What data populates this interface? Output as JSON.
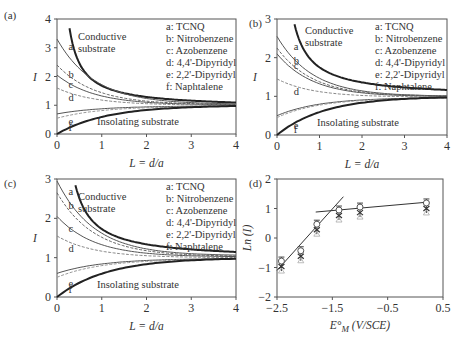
{
  "figure": {
    "legend": [
      "a: TCNQ",
      "b: Nitrobenzene",
      "c: Azobenzene",
      "d: 4,4'-Dipyridyl",
      "e: 2,2'-Dipyridyl",
      "f: Naphtalene"
    ],
    "curve_letters": [
      "a",
      "b",
      "c",
      "d",
      "e",
      "f"
    ],
    "conductive_label_1": "Conductive",
    "conductive_label_2": "substrate",
    "insolating_label": "Insolating substrate",
    "xlabel_abc": "L = d/a",
    "ylabel_abc": "I",
    "xlabel_d": "E°M (V/SCE)",
    "ylabel_d": "Ln (I)"
  },
  "chart_data": [
    {
      "panel": "(a)",
      "type": "line",
      "xlabel": "L = d/a",
      "ylabel": "I",
      "xlim": [
        0,
        4
      ],
      "ylim": [
        0,
        4
      ],
      "xticks": [
        "0",
        "1",
        "2",
        "3",
        "4"
      ],
      "yticks": [
        "0",
        "1",
        "2",
        "3",
        "4"
      ],
      "annotations": [
        "Conductive substrate",
        "Insolating substrate"
      ],
      "legend": [
        "a: TCNQ",
        "b: Nitrobenzene",
        "c: Azobenzene",
        "d: 4,4'-Dipyridyl",
        "e: 2,2'-Dipyridyl",
        "f: Naphtalene"
      ],
      "series": [
        {
          "name": "Conductive substrate",
          "I_at_L0": null,
          "I_at_L4": 1.05
        },
        {
          "name": "a: TCNQ",
          "I_at_L0": 3.3,
          "I_at_L4": 1.03
        },
        {
          "name": "b: Nitrobenzene",
          "I_at_L0": 2.4,
          "I_at_L4": 1.02
        },
        {
          "name": "c: Azobenzene",
          "I_at_L0": 2.05,
          "I_at_L4": 1.01
        },
        {
          "name": "d: 4,4'-Dipyridyl",
          "I_at_L0": 1.6,
          "I_at_L4": 1.0
        },
        {
          "name": "e: 2,2'-Dipyridyl",
          "I_at_L0": 0.7,
          "I_at_L4": 0.98
        },
        {
          "name": "f: Naphtalene",
          "I_at_L0": 0.55,
          "I_at_L4": 0.97
        },
        {
          "name": "Insolating substrate",
          "I_at_L0": 0.0,
          "I_at_L4": 0.95
        }
      ]
    },
    {
      "panel": "(b)",
      "type": "line",
      "xlabel": "L = d/a",
      "ylabel": "I",
      "xlim": [
        0,
        4
      ],
      "ylim": [
        0,
        3
      ],
      "xticks": [
        "0",
        "1",
        "2",
        "3",
        "4"
      ],
      "yticks": [
        "0",
        "1",
        "2",
        "3"
      ],
      "annotations": [
        "Conductive substrate",
        "Insolating substrate"
      ],
      "legend": [
        "a: TCNQ",
        "b: Nitrobenzene",
        "c: Azobenzene",
        "d: 4,4'-Dipyridyl",
        "e: 2,2'-Dipyridyl",
        "f: Naphtalene"
      ],
      "series": [
        {
          "name": "Conductive substrate",
          "I_at_L0": null,
          "I_at_L4": 1.12
        },
        {
          "name": "a: TCNQ",
          "I_at_L0": 2.55,
          "I_at_L4": 1.0
        },
        {
          "name": "b: Nitrobenzene",
          "I_at_L0": 2.25,
          "I_at_L4": 1.0
        },
        {
          "name": "c: Azobenzene",
          "I_at_L0": 2.1,
          "I_at_L4": 0.99
        },
        {
          "name": "d: 4,4'-Dipyridyl",
          "I_at_L0": 1.45,
          "I_at_L4": 0.98
        },
        {
          "name": "e: 2,2'-Dipyridyl",
          "I_at_L0": 0.5,
          "I_at_L4": 0.97
        },
        {
          "name": "f: Naphtalene",
          "I_at_L0": 0.45,
          "I_at_L4": 0.96
        },
        {
          "name": "Insolating substrate",
          "I_at_L0": 0.0,
          "I_at_L4": 0.95
        }
      ]
    },
    {
      "panel": "(c)",
      "type": "line",
      "xlabel": "L = d/a",
      "ylabel": "I",
      "xlim": [
        0,
        4
      ],
      "ylim": [
        0,
        3
      ],
      "xticks": [
        "0",
        "1",
        "2",
        "3",
        "4"
      ],
      "yticks": [
        "0",
        "1",
        "2",
        "3"
      ],
      "annotations": [
        "Conductive substrate",
        "Insolating substrate"
      ],
      "legend": [
        "a: TCNQ",
        "b: Nitrobenzene",
        "c: Azobenzene",
        "d: 4,4'-Dipyridyl",
        "e: 2,2'-Dipyridyl",
        "f: Naphtalene"
      ],
      "series": [
        {
          "name": "Conductive substrate",
          "I_at_L0": null,
          "I_at_L4": 1.1
        },
        {
          "name": "a: TCNQ",
          "I_at_L0": 2.95,
          "I_at_L4": 1.05
        },
        {
          "name": "b: Nitrobenzene",
          "I_at_L0": 2.65,
          "I_at_L4": 1.03
        },
        {
          "name": "c: Azobenzene",
          "I_at_L0": 2.05,
          "I_at_L4": 1.02
        },
        {
          "name": "d: 4,4'-Dipyridyl",
          "I_at_L0": 1.55,
          "I_at_L4": 1.0
        },
        {
          "name": "e: 2,2'-Dipyridyl",
          "I_at_L0": 0.6,
          "I_at_L4": 0.98
        },
        {
          "name": "f: Naphtalene",
          "I_at_L0": 0.5,
          "I_at_L4": 0.97
        },
        {
          "name": "Insolating substrate",
          "I_at_L0": 0.0,
          "I_at_L4": 0.95
        }
      ]
    },
    {
      "panel": "(d)",
      "type": "scatter",
      "xlabel": "E°M (V/SCE)",
      "ylabel": "Ln (I)",
      "xlim": [
        -2.5,
        0.5
      ],
      "ylim": [
        -2,
        2
      ],
      "xticks": [
        "-2.5",
        "-1.5",
        "-0.5",
        "0.5"
      ],
      "yticks": [
        "-2",
        "-1",
        "0",
        "1",
        "2"
      ],
      "series": [
        {
          "name": "data",
          "x": [
            -2.42,
            -2.07,
            -1.78,
            -1.38,
            -1.0,
            0.2
          ],
          "y": [
            -0.85,
            -0.5,
            0.4,
            0.88,
            0.98,
            1.12
          ]
        }
      ],
      "fit_lines": [
        {
          "x": [
            -2.5,
            -1.3
          ],
          "y": [
            -1.1,
            1.4
          ]
        },
        {
          "x": [
            -1.8,
            0.25
          ],
          "y": [
            0.88,
            1.22
          ]
        }
      ]
    }
  ]
}
